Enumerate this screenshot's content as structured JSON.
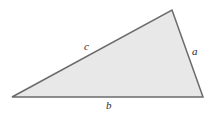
{
  "figure": {
    "name": "triangle-diagram",
    "canvas": {
      "width": 213,
      "height": 115,
      "background": "#ffffff"
    },
    "shape": {
      "type": "triangle",
      "fill_color": "#e8e8e8",
      "stroke_color": "#6b6b6b",
      "stroke_width": 1.5,
      "points": "172,10 203,97 12,97",
      "vertices": [
        {
          "name": "apex",
          "x": 172,
          "y": 10
        },
        {
          "name": "bottom-right",
          "x": 203,
          "y": 97
        },
        {
          "name": "bottom-left",
          "x": 12,
          "y": 97
        }
      ]
    },
    "labels": [
      {
        "id": "c",
        "text": "c",
        "side": "upper-left",
        "x": 88,
        "y": 47
      },
      {
        "id": "a",
        "text": "a",
        "side": "right",
        "x": 196,
        "y": 52
      },
      {
        "id": "b",
        "text": "b",
        "side": "base",
        "x": 110,
        "y": 107
      }
    ]
  }
}
